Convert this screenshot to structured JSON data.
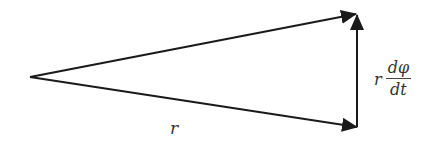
{
  "diagram": {
    "colors": {
      "line": "#1a1a1a",
      "text": "#333333",
      "background": "#ffffff"
    },
    "vertices": {
      "origin": [
        30,
        77
      ],
      "upper_tip": [
        357,
        14
      ],
      "lower_tip": [
        357,
        127
      ]
    },
    "arrows": [
      {
        "name": "upper-vector",
        "from": [
          30,
          77
        ],
        "to": [
          357,
          14
        ]
      },
      {
        "name": "lower-vector",
        "from": [
          30,
          77
        ],
        "to": [
          357,
          127
        ]
      },
      {
        "name": "tangential-vector",
        "from": [
          357,
          127
        ],
        "to": [
          357,
          14
        ]
      }
    ],
    "labels": {
      "bottom_r": "r",
      "rate_coefficient": "r",
      "rate_numerator": "dφ",
      "rate_denominator": "dt"
    }
  }
}
